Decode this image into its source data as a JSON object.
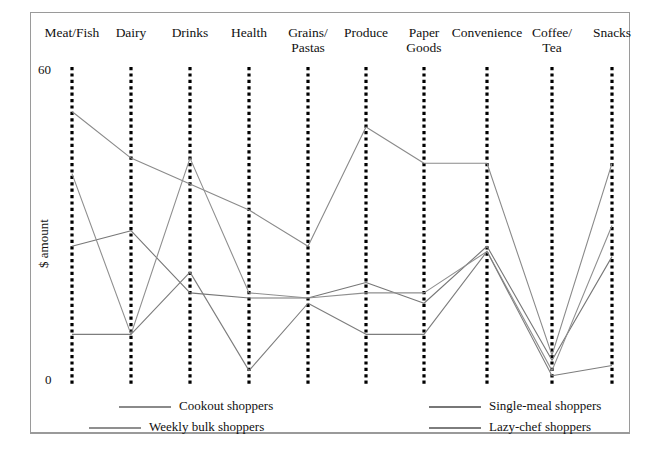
{
  "chart_data": {
    "type": "line",
    "title": "",
    "subtitle": "",
    "xlabel": "",
    "ylabel": "$ amount",
    "ylim": [
      0,
      60
    ],
    "yticks": [
      0,
      60
    ],
    "ytick_labels": [
      "0",
      "60"
    ],
    "grid": false,
    "legend_position": "bottom",
    "axis_style": "dotted-vertical",
    "categories": [
      "Meat/Fish",
      "Dairy",
      "Drinks",
      "Health",
      "Grains/\nPastas",
      "Produce",
      "Paper\nGoods",
      "Convenience",
      "Coffee/\nTea",
      "Snacks"
    ],
    "category_labels": [
      {
        "line1": "Meat/Fish",
        "line2": ""
      },
      {
        "line1": "Dairy",
        "line2": ""
      },
      {
        "line1": "Drinks",
        "line2": ""
      },
      {
        "line1": "Health",
        "line2": ""
      },
      {
        "line1": "Grains/",
        "line2": "Pastas"
      },
      {
        "line1": "Produce",
        "line2": ""
      },
      {
        "line1": "Paper",
        "line2": "Goods"
      },
      {
        "line1": "Convenience",
        "line2": ""
      },
      {
        "line1": "Coffee/",
        "line2": "Tea"
      },
      {
        "line1": "Snacks",
        "line2": ""
      }
    ],
    "series": [
      {
        "name": "Cookout shoppers",
        "color": "#8a8a8a",
        "values": [
          52,
          43,
          38,
          33,
          26,
          49,
          42,
          42,
          5,
          42
        ]
      },
      {
        "name": "Single-meal shoppers",
        "color": "#777777",
        "values": [
          26,
          29,
          17,
          16,
          16,
          19,
          15,
          26,
          4,
          24
        ]
      },
      {
        "name": "Weekly bulk shoppers",
        "color": "#8f8f8f",
        "values": [
          40,
          9,
          43,
          17,
          16,
          17,
          17,
          25,
          2,
          30
        ]
      },
      {
        "name": "Lazy-chef shoppers",
        "color": "#7d7d7d",
        "values": [
          9,
          9,
          21,
          2,
          15,
          9,
          9,
          25,
          1,
          3
        ]
      }
    ]
  },
  "legend": {
    "entries": [
      {
        "label": "Cookout shoppers"
      },
      {
        "label": "Single-meal shoppers"
      },
      {
        "label": "Weekly bulk shoppers"
      },
      {
        "label": "Lazy-chef shoppers"
      }
    ]
  }
}
